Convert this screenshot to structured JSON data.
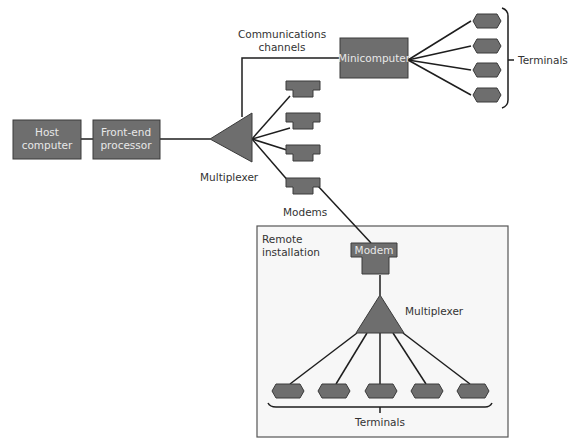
{
  "diagram": {
    "type": "network topology",
    "nodes": {
      "host": {
        "label_line1": "Host",
        "label_line2": "computer"
      },
      "fep": {
        "label_line1": "Front-end",
        "label_line2": "processor"
      },
      "mux_main": {
        "label": "Multiplexer"
      },
      "minicomputer": {
        "label": "Minicomputer"
      },
      "comm_channels": {
        "label_line1": "Communications",
        "label_line2": "channels"
      },
      "modems": {
        "label": "Modems",
        "count": 4
      },
      "mini_terminals": {
        "label": "Terminals",
        "count": 4
      },
      "remote": {
        "label_line1": "Remote",
        "label_line2": "installation",
        "modem": {
          "label": "Modem"
        },
        "mux": {
          "label": "Multiplexer"
        },
        "terminals": {
          "label": "Terminals",
          "count": 5
        }
      }
    },
    "colors": {
      "node_fill": "#6e6e6e",
      "node_stroke": "#3a3a3a",
      "line": "#1e1e1e",
      "remote_bg": "#f7f7f7",
      "text": "#333333",
      "text_on_node": "#e8e8e8"
    }
  }
}
